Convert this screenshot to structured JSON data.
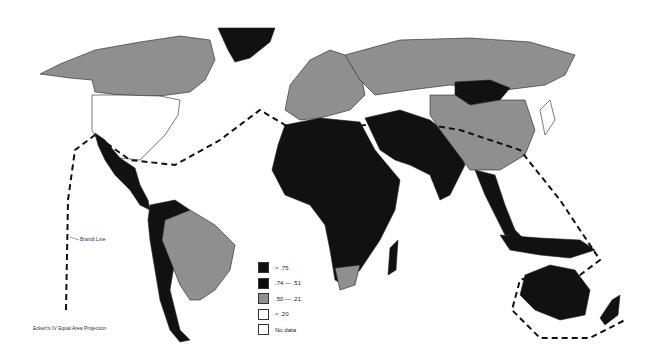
{
  "map": {
    "projection_label": "Eckert's IV Equal Area Projection",
    "brandt_line_label": "Brandt Line",
    "legend": [
      {
        "label": "> .75",
        "color": "#111111"
      },
      {
        "label": ".74 — .51",
        "color": "#0b0b0b"
      },
      {
        "label": ".50 — .21",
        "color": "#8f8f8f"
      },
      {
        "label": "< .20",
        "color": "#ffffff"
      },
      {
        "label": "No data",
        "color": "#ffffff"
      }
    ],
    "regions": [
      {
        "name": "Canada",
        "class": ".50 — .21"
      },
      {
        "name": "United States",
        "class": "< .20"
      },
      {
        "name": "Greenland",
        "class": "> .75"
      },
      {
        "name": "Mexico & Central America",
        "class": "> .75"
      },
      {
        "name": "South America (west/north)",
        "class": "> .75"
      },
      {
        "name": "Brazil",
        "class": ".50 — .21"
      },
      {
        "name": "Africa",
        "class": "> .75"
      },
      {
        "name": "South Africa",
        "class": ".50 — .21"
      },
      {
        "name": "Europe",
        "class": "mixed"
      },
      {
        "name": "Russia/USSR",
        "class": ".50 — .21"
      },
      {
        "name": "Mongolia",
        "class": "> .75"
      },
      {
        "name": "China",
        "class": ".50 — .21"
      },
      {
        "name": "Middle East & South Asia",
        "class": "> .75"
      },
      {
        "name": "Southeast Asia",
        "class": "mixed"
      },
      {
        "name": "Japan",
        "class": "< .20"
      },
      {
        "name": "Australia",
        "class": "> .75"
      },
      {
        "name": "New Zealand",
        "class": "> .75"
      }
    ]
  }
}
